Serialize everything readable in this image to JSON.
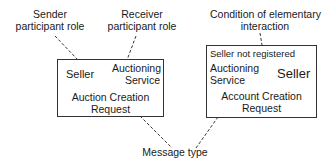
{
  "annotations": {
    "sender_role": [
      "Sender",
      "participant role"
    ],
    "receiver_role": [
      "Receiver",
      "participant role"
    ],
    "condition": [
      "Condition of elementary",
      "interaction"
    ],
    "message_type": "Message type"
  },
  "left_interaction": {
    "sender": "Seller",
    "receiver": [
      "Auctioning",
      "Service"
    ],
    "message": [
      "Auction Creation",
      "Request"
    ]
  },
  "right_interaction": {
    "condition": "Seller not registered",
    "sender": [
      "Auctioning",
      "Service"
    ],
    "receiver": "Seller",
    "message": [
      "Account Creation",
      "Request"
    ]
  },
  "colors": {
    "stroke": "#333333",
    "text": "#1a1a1a",
    "background": "#ffffff"
  }
}
